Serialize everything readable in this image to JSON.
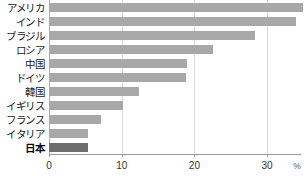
{
  "chart_data": {
    "type": "bar",
    "orientation": "horizontal",
    "title": "",
    "xlabel": "%",
    "ylabel": "",
    "xlim": [
      0,
      35.7
    ],
    "ticks": [
      0,
      10,
      20,
      30
    ],
    "grid": true,
    "legend": "none",
    "unit_label": "%",
    "categories": [
      "アメリカ",
      "インド",
      "ブラジル",
      "ロシア",
      "中国",
      "ドイツ",
      "韓国",
      "イギリス",
      "フランス",
      "イタリア",
      "日本"
    ],
    "values": [
      34.9,
      34.0,
      28.4,
      22.5,
      19.0,
      18.9,
      12.4,
      10.2,
      7.2,
      5.4,
      5.3
    ],
    "highlight_category": "日本",
    "colors": {
      "bar": "#a8a8a8",
      "bar_highlight": "#6e6e6e",
      "grid": "#d8d8d8",
      "axis": "#9a9a9a",
      "text": "#1a1a1a"
    }
  }
}
